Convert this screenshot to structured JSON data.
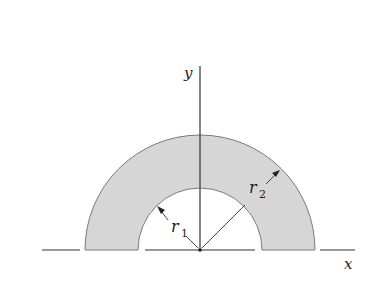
{
  "diagram": {
    "type": "half-annulus",
    "colors": {
      "background": "#ffffff",
      "ring_fill": "#d6d6d6",
      "ring_stroke": "#7a7a7a",
      "axis": "#333333",
      "text": "#222222"
    },
    "axes": {
      "x_label": "x",
      "y_label": "y"
    },
    "radii": {
      "inner": {
        "symbol": "r",
        "subscript": "1"
      },
      "outer": {
        "symbol": "r",
        "subscript": "2"
      }
    },
    "geometry": {
      "origin_px": [
        200,
        250
      ],
      "inner_radius_px": 62,
      "outer_radius_px": 115
    }
  }
}
